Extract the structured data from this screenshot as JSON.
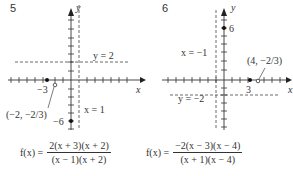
{
  "problems": [
    {
      "number": "5",
      "axis_x_label": "x",
      "axis_y_label": "y",
      "horizontal_asymptote_label": "y = 2",
      "vertical_asymptote_label": "x = 1",
      "x_intercept_label": "−3",
      "y_intercept_label": "−6",
      "hole_label": "(−2, −2/3)",
      "formula": {
        "lhs": "f(x) =",
        "numerator": "2(x + 3)(x + 2)",
        "denominator": "(x − 1)(x + 2)"
      }
    },
    {
      "number": "6",
      "axis_x_label": "x",
      "axis_y_label": "y",
      "horizontal_asymptote_label": "y = −2",
      "vertical_asymptote_label": "x = −1",
      "x_intercept_label": "3",
      "y_intercept_label": "6",
      "hole_label": "(4, −2/3)",
      "formula": {
        "lhs": "f(x) =",
        "numerator": "−2(x − 3)(x − 4)",
        "denominator": "(x + 1)(x − 4)"
      }
    }
  ]
}
